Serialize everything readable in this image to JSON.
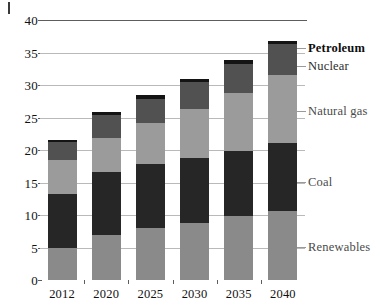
{
  "chart_data": {
    "type": "bar",
    "stacked": true,
    "title": "",
    "subtitle": "",
    "xlabel": "",
    "ylabel": "",
    "categories": [
      "2012",
      "2020",
      "2025",
      "2030",
      "2035",
      "2040"
    ],
    "ylim": [
      0,
      40
    ],
    "y_ticks": [
      0,
      5,
      10,
      15,
      20,
      25,
      30,
      35,
      40
    ],
    "grid": true,
    "legend_position": "right-inline",
    "series": [
      {
        "name": "Renewables",
        "color": "#8a8a8a",
        "values": [
          4.9,
          7.0,
          8.0,
          8.8,
          9.8,
          10.6
        ]
      },
      {
        "name": "Coal",
        "color": "#262626",
        "values": [
          8.4,
          9.6,
          9.9,
          9.9,
          10.1,
          10.5
        ]
      },
      {
        "name": "Natural gas",
        "color": "#9b9b9b",
        "values": [
          5.1,
          5.2,
          6.2,
          7.6,
          8.9,
          10.5
        ]
      },
      {
        "name": "Nuclear",
        "color": "#515151",
        "values": [
          2.8,
          3.6,
          3.8,
          4.1,
          4.5,
          4.7
        ]
      },
      {
        "name": "Petroleum",
        "color": "#141414",
        "values": [
          0.4,
          0.5,
          0.5,
          0.5,
          0.5,
          0.5
        ]
      }
    ],
    "totals": [
      21.6,
      25.9,
      28.4,
      30.9,
      33.8,
      36.8
    ]
  },
  "legend": {
    "items": [
      {
        "label": "Petroleum",
        "style": "bold"
      },
      {
        "label": "Nuclear",
        "style": "normal"
      },
      {
        "label": "Natural gas",
        "style": "muted"
      },
      {
        "label": "Coal",
        "style": "muted"
      },
      {
        "label": "Renewables",
        "style": "muted"
      }
    ]
  },
  "axes": {
    "y_tick_labels": [
      "40",
      "35",
      "30",
      "25",
      "20",
      "15",
      "10",
      "5",
      "0"
    ],
    "x_tick_labels": [
      "2012",
      "2020",
      "2025",
      "2030",
      "2035",
      "2040"
    ]
  }
}
